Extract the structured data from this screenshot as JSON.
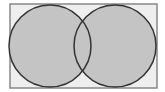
{
  "diagram": {
    "type": "venn",
    "shaded_region": "A union B",
    "colors": {
      "background": "#ffffff",
      "universe_fill": "#eeeeee",
      "universe_stroke": "#888888",
      "set_fill": "#c4c4c4",
      "set_stroke": "#333333"
    },
    "universe": {
      "x": 10,
      "y": 4,
      "width": 147,
      "height": 84
    },
    "sets": [
      {
        "name": "A",
        "cx": 50,
        "cy": 46,
        "r": 41
      },
      {
        "name": "B",
        "cx": 115,
        "cy": 46,
        "r": 41
      }
    ]
  }
}
